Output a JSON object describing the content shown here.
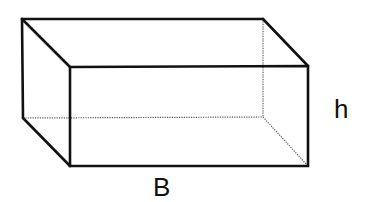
{
  "figure": {
    "type": "rectangular-prism",
    "stroke_color": "#111111",
    "hidden_edge_color": "#555555",
    "background": "#ffffff"
  },
  "labels": {
    "height": "h",
    "base": "B"
  },
  "vertices": {
    "back_top_left": [
      22,
      19
    ],
    "back_top_right": [
      263,
      19
    ],
    "back_bottom_left": [
      23,
      118
    ],
    "back_bottom_right": [
      263,
      117
    ],
    "front_top_left": [
      70,
      67
    ],
    "front_top_right": [
      308,
      66
    ],
    "front_bottom_left": [
      70,
      166
    ],
    "front_bottom_right": [
      308,
      166
    ]
  }
}
